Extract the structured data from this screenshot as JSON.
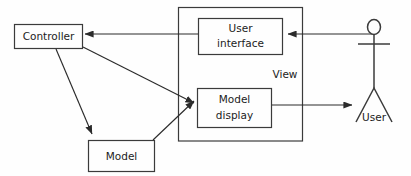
{
  "diagram": {
    "type": "block-diagram",
    "colors": {
      "background": "#fefefe",
      "stroke": "#3b3b3b",
      "edge": "#2b2b2b",
      "text": "#1c1c1c"
    },
    "nodes": [
      {
        "id": "controller",
        "label": "Controller",
        "kind": "box"
      },
      {
        "id": "model",
        "label": "Model",
        "kind": "box"
      },
      {
        "id": "user-interface",
        "label_line1": "User",
        "label_line2": "interface",
        "kind": "box"
      },
      {
        "id": "model-display",
        "label_line1": "Model",
        "label_line2": "display",
        "kind": "box"
      },
      {
        "id": "view",
        "label": "View",
        "kind": "group"
      },
      {
        "id": "user",
        "label": "User",
        "kind": "actor"
      }
    ],
    "edges": [
      {
        "id": "ui-to-controller",
        "from": "user-interface",
        "to": "controller",
        "arrow": "to"
      },
      {
        "id": "controller-to-model-display",
        "from": "controller",
        "to": "model-display",
        "arrow": "to"
      },
      {
        "id": "controller-to-model",
        "from": "controller",
        "to": "model",
        "arrow": "to"
      },
      {
        "id": "model-to-model-display",
        "from": "model",
        "to": "model-display",
        "arrow": "to"
      },
      {
        "id": "user-to-user-interface",
        "from": "user",
        "to": "user-interface",
        "arrow": "to"
      },
      {
        "id": "model-display-to-user",
        "from": "model-display",
        "to": "user",
        "arrow": "to"
      }
    ]
  }
}
